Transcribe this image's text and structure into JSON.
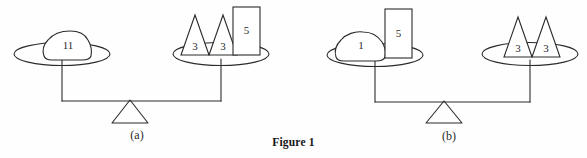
{
  "figure": {
    "title": "Figure 1",
    "background_color": "#fefefe",
    "line_color": "#2b2b2b",
    "panels": [
      {
        "id": "a",
        "caption": "(a)",
        "left_pan": {
          "items": [
            {
              "shape": "blob",
              "label": "11"
            }
          ]
        },
        "right_pan": {
          "items": [
            {
              "shape": "triangle",
              "label": "3"
            },
            {
              "shape": "triangle",
              "label": "3"
            },
            {
              "shape": "rectangle",
              "label": "5"
            }
          ]
        }
      },
      {
        "id": "b",
        "caption": "(b)",
        "left_pan": {
          "items": [
            {
              "shape": "blob",
              "label": "1"
            },
            {
              "shape": "rectangle",
              "label": "5"
            }
          ]
        },
        "right_pan": {
          "items": [
            {
              "shape": "triangle",
              "label": "3"
            },
            {
              "shape": "triangle",
              "label": "3"
            }
          ]
        }
      }
    ],
    "labels": {
      "a_blob_11": "11",
      "a_tri_left_3": "3",
      "a_tri_right_3": "3",
      "a_rect_5": "5",
      "a_caption": "(a)",
      "b_blob_1": "1",
      "b_rect_5": "5",
      "b_tri_left_3": "3",
      "b_tri_right_3": "3",
      "b_caption": "(b)"
    }
  }
}
